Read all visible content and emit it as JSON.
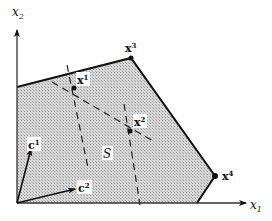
{
  "diagram": {
    "axes": {
      "x_label": "x",
      "x_sub": "1",
      "y_label": "x",
      "y_sub": "2"
    },
    "region_label": "S",
    "vertices": [
      {
        "name": "x",
        "sup": "3"
      },
      {
        "name": "x",
        "sup": "4"
      }
    ],
    "interior_points": [
      {
        "name": "x",
        "sup": "1"
      },
      {
        "name": "x",
        "sup": "2"
      }
    ],
    "vectors": [
      {
        "name": "c",
        "sup": "1"
      },
      {
        "name": "c",
        "sup": "2"
      }
    ],
    "colors": {
      "region_fill": "#c8c8c8",
      "stroke": "#111111"
    }
  }
}
